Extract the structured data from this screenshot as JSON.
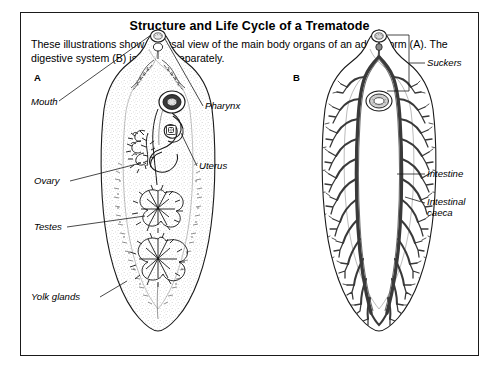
{
  "figure": {
    "title": "Structure and Life Cycle of a Trematode",
    "caption": "These illustrations show a dorsal view of the main body organs of an adult worm (A). The digestive system (B) is shown separately.",
    "border_color": "#1a1a1a",
    "background_color": "#ffffff",
    "ink_color": "#1a1a1a"
  },
  "panels": [
    {
      "letter": "A",
      "name": "adult-worm-organs",
      "subject": "adult trematode worm showing main body organs, dorsal view",
      "labels": [
        {
          "text": "Mouth",
          "side": "left",
          "target": "oral sucker / mouth at anterior tip"
        },
        {
          "text": "Pharynx",
          "side": "right",
          "target": "muscular pharynx behind mouth"
        },
        {
          "text": "Uterus",
          "side": "right",
          "target": "coiled uterus in mid-body"
        },
        {
          "text": "Ovary",
          "side": "left",
          "target": "branched ovary, left of midline"
        },
        {
          "text": "Testes",
          "side": "left",
          "target": "branched testes in posterior half"
        },
        {
          "text": "Yolk glands",
          "side": "left",
          "target": "vitelline (yolk) glands along body margins"
        }
      ]
    },
    {
      "letter": "B",
      "name": "digestive-system",
      "subject": "digestive system of the trematode shown separately",
      "labels": [
        {
          "text": "Suckers",
          "side": "right",
          "bracket": true,
          "target": "oral sucker and ventral sucker"
        },
        {
          "text": "Intestine",
          "side": "right",
          "target": "intestine running down body"
        },
        {
          "text": "Intestinal caeca",
          "side": "right",
          "two_line": true,
          "line1": "Intestinal",
          "line2": "caeca",
          "target": "branched intestinal caeca"
        }
      ]
    }
  ]
}
